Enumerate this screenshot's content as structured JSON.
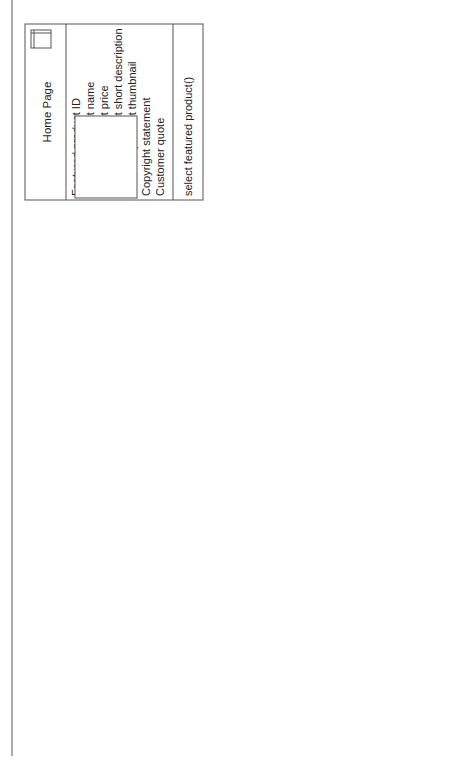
{
  "diagram": {
    "type": "uml-navigation-class-diagram",
    "classes": {
      "home_page": {
        "name": "Home Page",
        "icon": "class-window-icon",
        "attributes": [
          "Featured product ID",
          "Featured product name",
          "Featured product price",
          "Featured product short description",
          "Featured product thumbnail",
          "Copyright statement",
          "Customer quote"
        ],
        "operations": [
          "select featured product()"
        ]
      },
      "catalog": {
        "name": "Cata og $",
        "icon": "class-window-icon"
      },
      "category": {
        "name": "Category +",
        "icon": "class-window-icon",
        "attributes": [
          "Category ID",
          "Category name",
          "Category description",
          "Category image"
        ],
        "operations": [
          "scroll forward()",
          "scroll backward()",
          "select product()"
        ]
      },
      "category_item": {
        "name": "Category Item",
        "attributes": [
          "Id",
          "Name",
          "Description",
          "Image url : string"
        ]
      },
      "product_item": {
        "name": "Product Item",
        "attributes": [
          "Id",
          "Name",
          "Short description",
          "Price",
          "Availibility",
          "Thumbnail image url : string"
        ]
      },
      "product": {
        "name": "Product",
        "icon": "class-window-icon"
      }
    },
    "associations": {
      "browse": "Browse",
      "previous": "Previous",
      "next": "Next",
      "details": "Details",
      "featured_product": "Featured product",
      "categories_role": "+Categories",
      "categories_mult": "0..*",
      "subcategories_role": "+Subcategories",
      "subcategories_mult": "0..*",
      "products_role": "+Products",
      "products_mult": "0..*"
    }
  },
  "caption": {
    "label": "FIGURE 9-11",
    "text": "Navigational paths modeled with associations"
  }
}
